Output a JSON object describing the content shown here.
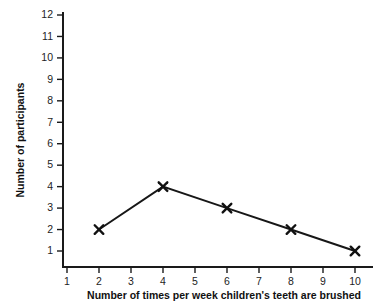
{
  "chart_data": {
    "type": "line",
    "title": "",
    "subtitle": "",
    "xlabel": "Number of times per week children's teeth are brushed",
    "ylabel": "Number of participants",
    "x": [
      2,
      4,
      6,
      8,
      10
    ],
    "values": [
      2,
      4,
      3,
      2,
      1
    ],
    "series": [
      {
        "name": "Number of participants",
        "x": [
          2,
          4,
          6,
          8,
          10
        ],
        "values": [
          2,
          4,
          3,
          2,
          1
        ]
      }
    ],
    "points": [
      {
        "x": 2,
        "y": 2
      },
      {
        "x": 4,
        "y": 4
      },
      {
        "x": 6,
        "y": 3
      },
      {
        "x": 8,
        "y": 2
      },
      {
        "x": 10,
        "y": 1
      }
    ],
    "xlim": [
      0.5,
      10.6
    ],
    "ylim": [
      0.2,
      12.4
    ],
    "xticks": [
      1,
      2,
      3,
      4,
      5,
      6,
      7,
      8,
      9,
      10
    ],
    "yticks": [
      1,
      2,
      3,
      4,
      5,
      6,
      7,
      8,
      9,
      10,
      11,
      12
    ],
    "xtick_labels": [
      "1",
      "2",
      "3",
      "4",
      "5",
      "6",
      "7",
      "8",
      "9",
      "10"
    ],
    "ytick_labels": [
      "1",
      "2",
      "3",
      "4",
      "5",
      "6",
      "7",
      "8",
      "9",
      "10",
      "11",
      "12"
    ],
    "grid": false,
    "legend": null,
    "legend_position": "none",
    "marker": "x",
    "line_color": "#171717",
    "marker_color": "#111111",
    "axis_color": "#1a1a1a",
    "background_color": "#ffffff",
    "annotations": []
  }
}
